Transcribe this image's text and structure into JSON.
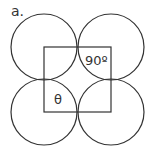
{
  "figure": {
    "label": "a.",
    "angle_labels": {
      "right_angle": "90º",
      "theta": "θ"
    },
    "stroke_color": "#333333",
    "shapes": {
      "circles": [
        {
          "name": "top-left",
          "cx": 44,
          "cy": 47,
          "r": 33
        },
        {
          "name": "top-right",
          "cx": 111,
          "cy": 47,
          "r": 33
        },
        {
          "name": "bottom-left",
          "cx": 44,
          "cy": 112,
          "r": 33
        },
        {
          "name": "bottom-right",
          "cx": 111,
          "cy": 112,
          "r": 33
        }
      ],
      "square": {
        "x": 44,
        "y": 47,
        "width": 67,
        "height": 65
      }
    }
  }
}
